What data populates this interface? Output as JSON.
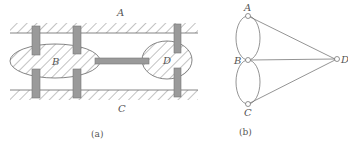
{
  "figure": {
    "panel_a": {
      "caption": "(a)",
      "labels": {
        "bank_top": "A",
        "bank_bottom": "C",
        "island_left": "B",
        "island_right": "D"
      },
      "bridge_count": 7
    },
    "panel_b": {
      "caption": "(b)",
      "nodes": [
        {
          "id": "A",
          "label": "A"
        },
        {
          "id": "B",
          "label": "B"
        },
        {
          "id": "C",
          "label": "C"
        },
        {
          "id": "D",
          "label": "D"
        }
      ],
      "edges": [
        [
          "A",
          "B"
        ],
        [
          "A",
          "B"
        ],
        [
          "B",
          "C"
        ],
        [
          "B",
          "C"
        ],
        [
          "A",
          "D"
        ],
        [
          "B",
          "D"
        ],
        [
          "C",
          "D"
        ]
      ]
    },
    "colors": {
      "line": "#555555",
      "bridge_fill": "#9a9a9a",
      "hatch": "#666666"
    }
  }
}
